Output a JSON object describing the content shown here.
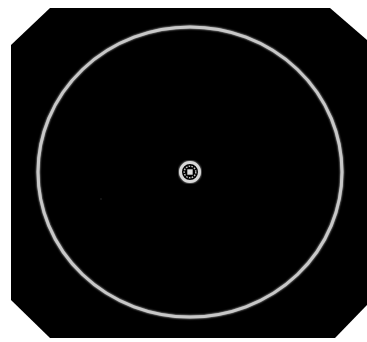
{
  "scene": {
    "background_color": "#ffffff",
    "panel_color": "#000000",
    "ring_color": "#c8c8c8",
    "hand_color": "#d0d0d0",
    "emblem_color": "#d8d8d8"
  },
  "dial": {
    "shape": "circle",
    "center": [
      190,
      172
    ],
    "radius_x": 152,
    "radius_y": 145
  },
  "hand": {
    "direction": "up",
    "from": [
      191,
      27
    ],
    "to": [
      191,
      161
    ]
  },
  "center_emblem": {
    "icon": "gear-icon",
    "center": [
      190,
      172
    ],
    "radius": 10
  }
}
